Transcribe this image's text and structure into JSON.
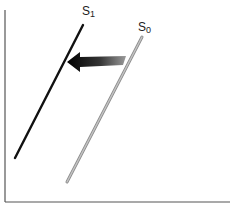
{
  "diagram": {
    "type": "supply-shift",
    "curves": [
      {
        "id": "S0",
        "label": "S",
        "subscript": "0",
        "color": "#a9a9a9",
        "start": [
          142,
          37
        ],
        "end": [
          67,
          182
        ]
      },
      {
        "id": "S1",
        "label": "S",
        "subscript": "1",
        "color": "#111111",
        "start": [
          83,
          25
        ],
        "end": [
          15,
          158
        ]
      }
    ],
    "arrow": {
      "direction": "left",
      "from": [
        126,
        61
      ],
      "to": [
        67,
        62
      ],
      "meaning": "supply decreases / shifts left"
    },
    "axes": {
      "color": "#555555",
      "y_axis_x": 5,
      "x_axis_y": 202
    }
  }
}
